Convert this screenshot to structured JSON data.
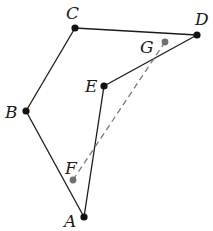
{
  "diagram": {
    "type": "geometry",
    "points": {
      "A": {
        "label": "A",
        "x": 84,
        "y": 217,
        "lx": 64,
        "ly": 227,
        "style": "main"
      },
      "B": {
        "label": "B",
        "x": 26,
        "y": 111,
        "lx": 5,
        "ly": 118,
        "style": "main"
      },
      "C": {
        "label": "C",
        "x": 75,
        "y": 28,
        "lx": 66,
        "ly": 19,
        "style": "main"
      },
      "D": {
        "label": "D",
        "x": 197,
        "y": 35,
        "lx": 195,
        "ly": 25,
        "style": "main"
      },
      "E": {
        "label": "E",
        "x": 104,
        "y": 86,
        "lx": 85,
        "ly": 92,
        "style": "main"
      },
      "F": {
        "label": "F",
        "x": 73,
        "y": 180,
        "lx": 65,
        "ly": 174,
        "style": "aux"
      },
      "G": {
        "label": "G",
        "x": 165,
        "y": 42,
        "lx": 140,
        "ly": 53,
        "style": "aux"
      }
    },
    "segments": [
      {
        "from": "A",
        "to": "B",
        "style": "solid"
      },
      {
        "from": "B",
        "to": "C",
        "style": "solid"
      },
      {
        "from": "C",
        "to": "D",
        "style": "solid"
      },
      {
        "from": "D",
        "to": "E",
        "style": "solid"
      },
      {
        "from": "E",
        "to": "A",
        "style": "solid"
      },
      {
        "from": "F",
        "to": "G",
        "style": "dashed"
      }
    ],
    "colors": {
      "line": "#1a1a1a",
      "dashed": "#7a7a7a",
      "main_point": "#111111",
      "aux_point": "#6f6f6f"
    }
  }
}
